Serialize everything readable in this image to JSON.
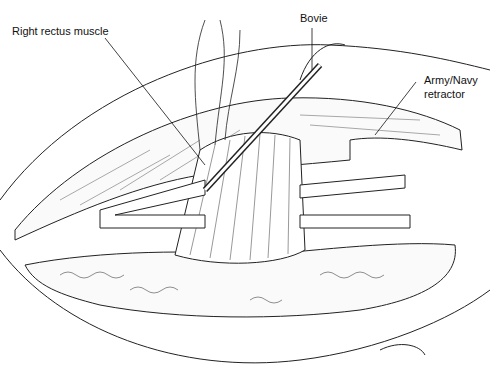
{
  "labels": {
    "rectus": "Right rectus muscle",
    "bovie": "Bovie",
    "retractor_line1": "Army/Navy",
    "retractor_line2": "retractor"
  }
}
